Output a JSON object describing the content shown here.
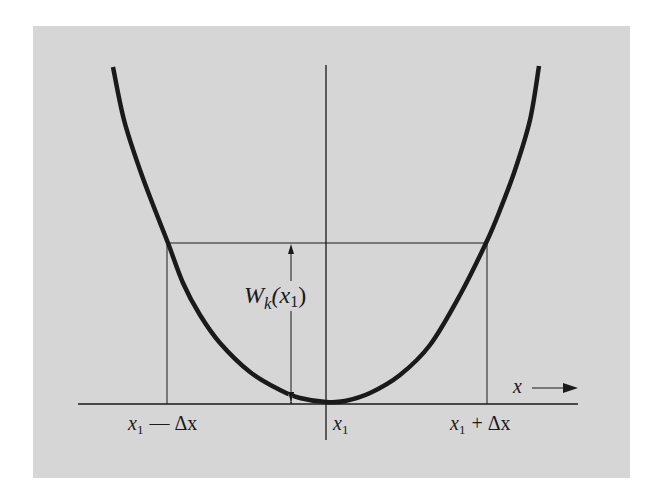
{
  "figure": {
    "background_color": "#d6d6d6",
    "ink_color": "#1a1a1a",
    "curve": {
      "description": "convex potential-like curve with minimum at x1",
      "points": [
        [
          113,
          67
        ],
        [
          124,
          120
        ],
        [
          140,
          170
        ],
        [
          155,
          210
        ],
        [
          168,
          243
        ],
        [
          183,
          283
        ],
        [
          200,
          315
        ],
        [
          220,
          343
        ],
        [
          250,
          372
        ],
        [
          280,
          390
        ],
        [
          300,
          398
        ],
        [
          326,
          402
        ],
        [
          345,
          401
        ],
        [
          370,
          393
        ],
        [
          400,
          375
        ],
        [
          430,
          345
        ],
        [
          460,
          295
        ],
        [
          486,
          243
        ],
        [
          500,
          210
        ],
        [
          515,
          170
        ],
        [
          530,
          120
        ],
        [
          539,
          66
        ]
      ]
    },
    "labels": {
      "function_label_main": "W",
      "function_label_sub": "k",
      "function_label_arg": "(x",
      "function_label_arg_sub": "1",
      "function_label_close": ")",
      "axis_label": "x",
      "tick_left_main": "x",
      "tick_left_sub": "1",
      "tick_left_rest": "— Δx",
      "tick_center_main": "x",
      "tick_center_sub": "1",
      "tick_right_main": "x",
      "tick_right_sub": "1",
      "tick_right_rest": "+ Δx"
    },
    "lines": {
      "x_axis": {
        "x1": 78,
        "x2": 578,
        "y": 404
      },
      "center_line": {
        "x": 326,
        "y1": 65,
        "y2": 440
      },
      "left_line": {
        "x": 167,
        "y1": 243,
        "y2": 404
      },
      "right_line": {
        "x": 487,
        "y1": 243,
        "y2": 404
      },
      "level_line": {
        "x1": 167,
        "x2": 487,
        "y": 243
      },
      "height_arrow": {
        "x": 291,
        "y_top": 244,
        "y_bottom": 400,
        "gap_top": 281,
        "gap_bottom": 310
      }
    }
  }
}
